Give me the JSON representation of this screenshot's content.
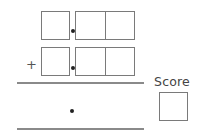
{
  "problem": {
    "operator": "+",
    "row1": {
      "digits": [
        "",
        "",
        ""
      ],
      "decimal_point": true
    },
    "row2": {
      "digits": [
        "",
        "",
        ""
      ],
      "decimal_point": true
    },
    "answer": {
      "value": "",
      "decimal_point": true
    }
  },
  "score": {
    "label": "Score",
    "value": ""
  }
}
